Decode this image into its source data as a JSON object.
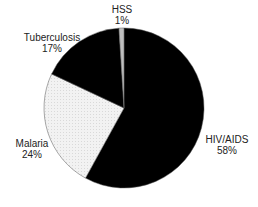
{
  "chart_data": {
    "type": "pie",
    "title": "",
    "categories": [
      "HIV/AIDS",
      "Malaria",
      "Tuberculosis",
      "HSS"
    ],
    "values": [
      58,
      24,
      17,
      1
    ],
    "unit": "%",
    "start_angle_deg": 0,
    "direction": "clockwise",
    "colors": [
      "#000000",
      "#eeeeee",
      "#000000",
      "#bfbfbf"
    ],
    "labels": [
      {
        "name": "HIV/AIDS",
        "pct": "58%"
      },
      {
        "name": "Malaria",
        "pct": "24%"
      },
      {
        "name": "Tuberculosis",
        "pct": "17%"
      },
      {
        "name": "HSS",
        "pct": "1%"
      }
    ],
    "legend": "none (data labels outside slices)"
  }
}
